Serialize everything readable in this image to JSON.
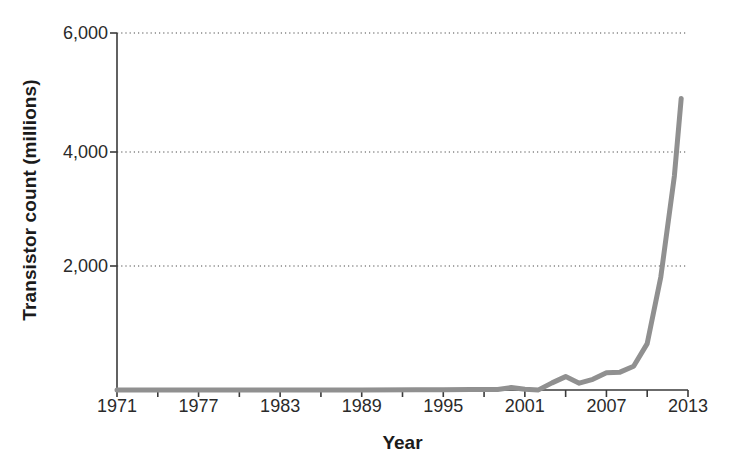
{
  "chart_data": {
    "type": "line",
    "title": "",
    "xlabel": "Year",
    "ylabel": "Transistor count (millions)",
    "xlim": [
      1971,
      2013
    ],
    "ylim": [
      0,
      6000
    ],
    "xticks": [
      1971,
      1977,
      1983,
      1989,
      1995,
      2001,
      2007,
      2013
    ],
    "xtick_labels": [
      "1971",
      "1977",
      "1983",
      "1989",
      "1995",
      "2001",
      "2007",
      "2013"
    ],
    "yticks": [
      2000,
      4000,
      6000
    ],
    "ytick_labels": [
      "2,000",
      "4,000",
      "6,000"
    ],
    "grid": "horizontal-dotted",
    "legend": "none",
    "line_color": "#909090",
    "line_width_px": 5,
    "series": [
      {
        "name": "Transistor count",
        "x": [
          1971,
          1974,
          1978,
          1982,
          1985,
          1989,
          1993,
          1995,
          1997,
          1999,
          2000,
          2001,
          2002,
          2003,
          2004,
          2005,
          2006,
          2007,
          2008,
          2009,
          2010,
          2011,
          2012,
          2012.5
        ],
        "values": [
          0,
          0,
          0,
          0,
          0,
          1,
          3,
          6,
          8,
          10,
          42,
          12,
          2,
          120,
          225,
          115,
          180,
          290,
          300,
          400,
          780,
          1900,
          3600,
          4900
        ]
      }
    ]
  },
  "axes": {
    "plot_left_px": 117,
    "plot_right_px": 688,
    "plot_top_px": 33,
    "plot_bottom_px": 390
  }
}
